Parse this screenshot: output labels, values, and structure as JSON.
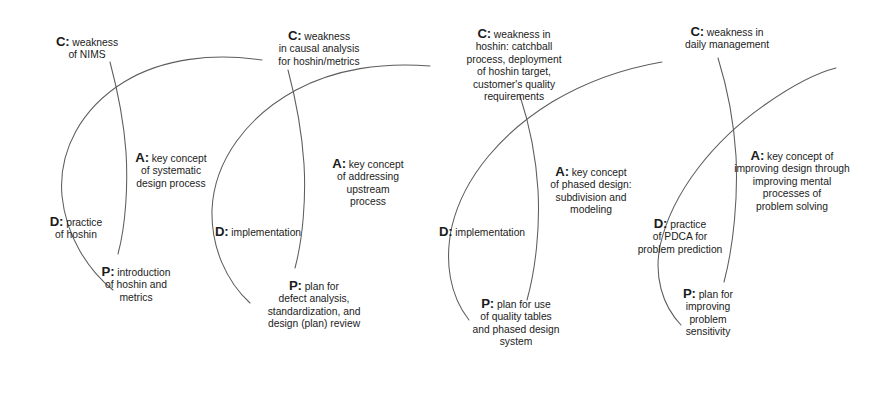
{
  "diagram": {
    "background": "#ffffff",
    "line_color": "#5d5d5d",
    "text_color": "#1b1b1b"
  },
  "cycles": [
    {
      "id": "cycle-1",
      "nodes": {
        "c": {
          "key": "C:",
          "lines": [
            "weakness",
            "of NIMS"
          ]
        },
        "a": {
          "key": "A:",
          "lines": [
            "key concept",
            "of systematic",
            "design process"
          ]
        },
        "d": {
          "key": "D:",
          "lines": [
            "practice",
            "of hoshin"
          ]
        },
        "p": {
          "key": "P:",
          "lines": [
            "introduction",
            "of hoshin and",
            "metrics"
          ]
        }
      }
    },
    {
      "id": "cycle-2",
      "nodes": {
        "c": {
          "key": "C:",
          "lines": [
            "weakness",
            "in causal analysis",
            "for hoshin/metrics"
          ]
        },
        "a": {
          "key": "A:",
          "lines": [
            "key concept",
            "of addressing",
            "upstream",
            "process"
          ]
        },
        "d": {
          "key": "D:",
          "lines": [
            "implementation"
          ]
        },
        "p": {
          "key": "P:",
          "lines": [
            "plan for",
            "defect analysis,",
            "standardization, and",
            "design (plan) review"
          ]
        }
      }
    },
    {
      "id": "cycle-3",
      "nodes": {
        "c": {
          "key": "C:",
          "lines": [
            "weakness in",
            "hoshin: catchball",
            "process, deployment",
            "of hoshin target,",
            "customer's quality",
            "requirements"
          ]
        },
        "a": {
          "key": "A:",
          "lines": [
            "key concept",
            "of phased design:",
            "subdivision and",
            "modeling"
          ]
        },
        "d": {
          "key": "D:",
          "lines": [
            "implementation"
          ]
        },
        "p": {
          "key": "P:",
          "lines": [
            "plan for use",
            "of quality tables",
            "and phased design",
            "system"
          ]
        }
      }
    },
    {
      "id": "cycle-4",
      "nodes": {
        "c": {
          "key": "C:",
          "lines": [
            "weakness in",
            "daily management"
          ]
        },
        "a": {
          "key": "A:",
          "lines": [
            "key concept of",
            "improving design through",
            "improving mental",
            "processes of",
            "problem solving"
          ]
        },
        "d": {
          "key": "D:",
          "lines": [
            "practice",
            "of PDCA for",
            "problem prediction"
          ]
        },
        "p": {
          "key": "P:",
          "lines": [
            "plan for",
            "improving",
            "problem",
            "sensitivity"
          ]
        }
      }
    }
  ]
}
